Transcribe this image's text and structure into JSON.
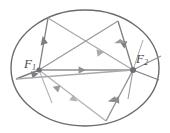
{
  "figure": {
    "name": "ellipse-reflection-diagram",
    "type": "geometric-diagram",
    "width": 170,
    "height": 133,
    "background_color": "#ffffff"
  },
  "labels": {
    "focus1": {
      "main": "F",
      "sub": "1",
      "x": 24,
      "y": 57
    },
    "focus2": {
      "main": "F",
      "sub": "2",
      "x": 136,
      "y": 52
    }
  },
  "colors": {
    "ellipse_stroke": "#6b6b6b",
    "ray_dark": "#7d7d82",
    "ray_light": "#a9a9ae",
    "ray_mid": "#8e8e93",
    "label_text": "#4a4a4a",
    "focus_dot": "#6f6f74"
  },
  "ellipse": {
    "cx": 85,
    "cy": 68,
    "rx": 74,
    "ry": 58,
    "stroke_width": 1.4
  },
  "foci": [
    {
      "id": "F1",
      "cx": 39,
      "cy": 70,
      "r": 2.6
    },
    {
      "id": "F2",
      "cx": 133,
      "cy": 70,
      "r": 3.0
    }
  ],
  "reflection_points": [
    {
      "id": "P-top-left",
      "x": 48,
      "y": 18
    },
    {
      "id": "P-top-right",
      "x": 118,
      "y": 21
    },
    {
      "id": "P-bottom-right",
      "x": 106,
      "y": 121
    },
    {
      "id": "P-left",
      "x": 16,
      "y": 79
    },
    {
      "id": "P-bottom-left",
      "x": 52,
      "y": 103
    }
  ],
  "rays": [
    {
      "id": "ray-f1-to-topleft",
      "from": "F1",
      "to": "P-top-left",
      "shade": "ray_dark",
      "arrow_at": 0.58
    },
    {
      "id": "ray-topleft-to-f2",
      "from": "P-top-left",
      "to": "F2",
      "shade": "ray_light",
      "arrow_at": 0.62
    },
    {
      "id": "ray-f1-to-topright",
      "from": "F1",
      "to": "P-top-right",
      "shade": "ray_mid",
      "arrow_at": 0.52
    },
    {
      "id": "ray-topright-to-f2",
      "from": "P-top-right",
      "to": "F2",
      "shade": "ray_dark",
      "arrow_at": 0.55
    },
    {
      "id": "ray-f1-to-f2-axis",
      "from": "F1",
      "to": "F2",
      "shade": "ray_mid",
      "arrow_at": 0.48
    },
    {
      "id": "ray-f1-to-bottomright",
      "from": "F1",
      "to": "P-bottom-right",
      "shade": "ray_light",
      "arrow_at": 0.42
    },
    {
      "id": "ray-bottomright-to-f2",
      "from": "P-bottom-right",
      "to": "F2",
      "shade": "ray_mid",
      "arrow_at": 0.45
    },
    {
      "id": "ray-f1-to-left",
      "from": "F1",
      "to": "P-left",
      "shade": "ray_dark",
      "arrow_at": 0.55
    },
    {
      "id": "ray-left-to-f2",
      "from": "P-left",
      "to": "F2",
      "shade": "ray_light",
      "arrow_at": 0.3
    },
    {
      "id": "ray-bottomleft-to-f2",
      "from": "P-bottom-left",
      "to": "F2",
      "shade": "ray_light",
      "arrow_at": 0.3
    }
  ],
  "tangent_marks": [
    {
      "id": "tangent-f2-upper-right",
      "x1": 133,
      "y1": 70,
      "x2": 160,
      "y2": 56
    },
    {
      "id": "tangent-f2-lower-right",
      "x1": 133,
      "y1": 70,
      "x2": 158,
      "y2": 79
    },
    {
      "id": "tangent-f2-down",
      "x1": 133,
      "y1": 70,
      "x2": 129,
      "y2": 97
    }
  ]
}
